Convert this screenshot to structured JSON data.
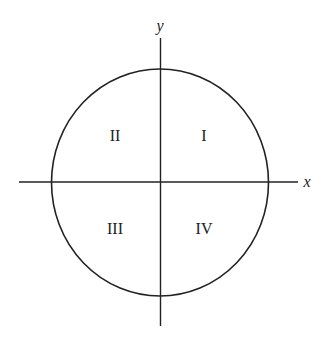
{
  "diagram": {
    "title": "",
    "axes": {
      "x_label": "x",
      "y_label": "y"
    },
    "quadrants": [
      {
        "id": "q1",
        "label": "I"
      },
      {
        "id": "q2",
        "label": "II"
      },
      {
        "id": "q3",
        "label": "III"
      },
      {
        "id": "q4",
        "label": "IV"
      }
    ],
    "colors": {
      "stroke": "#222222",
      "background": "#ffffff"
    }
  }
}
